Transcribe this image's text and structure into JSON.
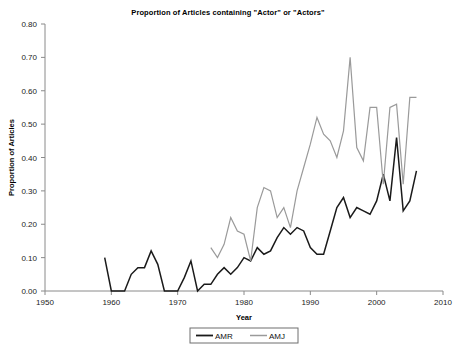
{
  "chart_data": {
    "type": "line",
    "title": "Proportion of Articles containing \"Actor\" or \"Actors\"",
    "xlabel": "Year",
    "ylabel": "Proportion of Articles",
    "xlim": [
      1950,
      2010
    ],
    "ylim": [
      0.0,
      0.8
    ],
    "xticks": [
      1950,
      1960,
      1970,
      1980,
      1990,
      2000,
      2010
    ],
    "xtick_labels": [
      "1950",
      "1960",
      "1970",
      "1980",
      "1990",
      "2000",
      "2010"
    ],
    "yticks": [
      0.0,
      0.1,
      0.2,
      0.3,
      0.4,
      0.5,
      0.6,
      0.7,
      0.8
    ],
    "ytick_labels": [
      "0.00",
      "0.10",
      "0.20",
      "0.30",
      "0.40",
      "0.50",
      "0.60",
      "0.70",
      "0.80"
    ],
    "grid": false,
    "legend_position": "bottom-center",
    "series": [
      {
        "name": "AMR",
        "color": "#1a1a1a",
        "width": 1.5,
        "x": [
          1959,
          1960,
          1961,
          1962,
          1963,
          1964,
          1965,
          1966,
          1967,
          1968,
          1969,
          1970,
          1971,
          1972,
          1973,
          1974,
          1975,
          1976,
          1977,
          1978,
          1979,
          1980,
          1981,
          1982,
          1983,
          1984,
          1985,
          1986,
          1987,
          1988,
          1989,
          1990,
          1991,
          1992,
          1993,
          1994,
          1995,
          1996,
          1997,
          1998,
          1999,
          2000,
          2001,
          2002,
          2003,
          2004,
          2005,
          2006
        ],
        "values": [
          0.1,
          0.0,
          0.0,
          0.0,
          0.05,
          0.07,
          0.07,
          0.12,
          0.08,
          0.0,
          0.0,
          0.0,
          0.04,
          0.09,
          0.0,
          0.02,
          0.02,
          0.05,
          0.07,
          0.05,
          0.07,
          0.1,
          0.09,
          0.13,
          0.11,
          0.12,
          0.16,
          0.19,
          0.17,
          0.19,
          0.18,
          0.13,
          0.11,
          0.11,
          0.18,
          0.25,
          0.28,
          0.22,
          0.25,
          0.24,
          0.23,
          0.27,
          0.35,
          0.27,
          0.46,
          0.24,
          0.27,
          0.36
        ]
      },
      {
        "name": "AMJ",
        "color": "#9a9a9a",
        "width": 1.2,
        "x": [
          1975,
          1976,
          1977,
          1978,
          1979,
          1980,
          1981,
          1982,
          1983,
          1984,
          1985,
          1986,
          1987,
          1988,
          1989,
          1990,
          1991,
          1992,
          1993,
          1994,
          1995,
          1996,
          1997,
          1998,
          1999,
          2000,
          2001,
          2002,
          2003,
          2004,
          2005,
          2006
        ],
        "values": [
          0.13,
          0.1,
          0.14,
          0.22,
          0.18,
          0.17,
          0.09,
          0.25,
          0.31,
          0.3,
          0.22,
          0.25,
          0.19,
          0.3,
          0.37,
          0.44,
          0.52,
          0.47,
          0.45,
          0.4,
          0.48,
          0.7,
          0.43,
          0.39,
          0.55,
          0.55,
          0.32,
          0.55,
          0.56,
          0.32,
          0.58,
          0.58
        ]
      }
    ]
  },
  "legend": {
    "items": [
      {
        "label": "AMR"
      },
      {
        "label": "AMJ"
      }
    ]
  }
}
